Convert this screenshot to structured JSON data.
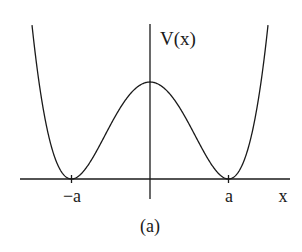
{
  "figure": {
    "caption": "(a)",
    "y_axis_label": "V(x)",
    "x_axis_label": "x",
    "tick_labels": [
      "−a",
      "a"
    ],
    "colors": {
      "stroke": "#1a1a1a",
      "background": "#ffffff"
    }
  },
  "curve": {
    "type": "double-well potential",
    "formula": "V(x) = k(x^2 - a^2)^2",
    "minima": [
      "-a",
      "a"
    ],
    "maximum_at": "0"
  },
  "geometry": {
    "origin_px": [
      150,
      179
    ],
    "a_px": 78.5,
    "peak_height_px": 97,
    "x_axis_px": [
      20,
      290
    ],
    "y_axis_top_px": 24,
    "curve_top_px": 26
  }
}
